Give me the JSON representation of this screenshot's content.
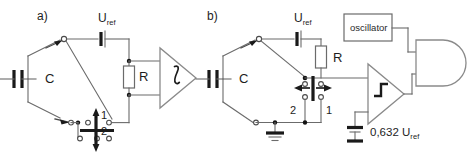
{
  "diagram": {
    "background_color": "#ffffff",
    "wire_color": "#6b6b6b",
    "ink_color": "#1a1a1a"
  },
  "panels": [
    {
      "id": "a",
      "label": "a)",
      "components": {
        "capacitor_label": "C",
        "resistor_label": "R",
        "source_label": "U",
        "source_sub": "ref",
        "amplifier_symbol": "∫",
        "amplifier_name": "integrator",
        "switch_pos_1": "1",
        "switch_pos_2": "2"
      }
    },
    {
      "id": "b",
      "label": "b)",
      "components": {
        "capacitor_label": "C",
        "resistor_label": "R",
        "source_label": "U",
        "source_sub": "ref",
        "oscillator_label": "oscillator",
        "comparator_symbol": "step",
        "comparator_name": "comparator",
        "gate_name": "and-gate",
        "switch_pos_1": "1",
        "switch_pos_2": "2",
        "threshold_value": "0,632 U",
        "threshold_sub": "ref"
      }
    }
  ]
}
